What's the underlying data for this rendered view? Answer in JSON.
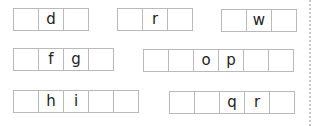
{
  "groups": [
    {
      "cells": [
        "",
        "d",
        ""
      ]
    },
    {
      "cells": [
        "",
        "r",
        ""
      ]
    },
    {
      "cells": [
        "",
        "w",
        ""
      ]
    },
    {
      "cells": [
        "",
        "f",
        "g",
        ""
      ]
    },
    {
      "cells": [
        "",
        "",
        "o",
        "p",
        "",
        ""
      ]
    },
    {
      "cells": [
        "",
        "h",
        "i",
        "",
        ""
      ]
    },
    {
      "cells": [
        "",
        "",
        "q",
        "r",
        ""
      ]
    }
  ]
}
